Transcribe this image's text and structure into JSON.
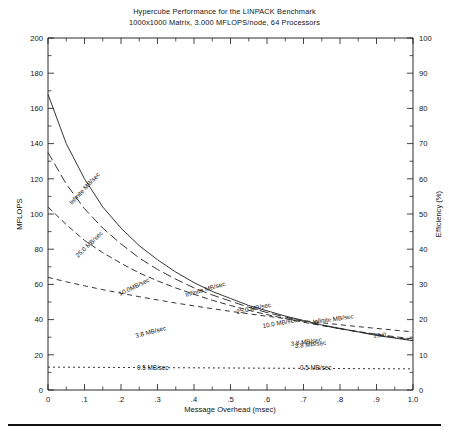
{
  "title": {
    "line1": "Hypercube Performance for the LINPACK Benchmark",
    "line2": "1000x1000 Matrix, 3.000 MFLOPS/node, 64 Processors"
  },
  "axes": {
    "y_left_title": "MFLOPS",
    "y_right_title": "Efficiency (%)",
    "x_title": "Message Overhead (msec)",
    "y_left_ticks": [
      "0",
      "20",
      "40",
      "60",
      "80",
      "100",
      "120",
      "140",
      "160",
      "180",
      "200"
    ],
    "y_right_ticks": [
      "0",
      "10",
      "20",
      "30",
      "40",
      "50",
      "60",
      "70",
      "80",
      "90",
      "100"
    ],
    "x_ticks": [
      "0",
      ".1",
      ".2",
      ".3",
      ".4",
      ".5",
      ".6",
      ".7",
      ".8",
      ".9",
      "1.0"
    ]
  },
  "curve_labels": {
    "infinite_1": "Infinite MB/sec",
    "infinite_2": "Infinite MB/sec",
    "infinite_3": "Infinite MB/sec",
    "mb25_1": "25.0 MB/sec",
    "mb25_2": "25.0 MB/sec",
    "mb25_3": "25.0",
    "mb10_1": "10.0MB/sec",
    "mb10_2": "10.0 MB/sec",
    "mb38_1": "3.8 MB/sec",
    "mb38_2": "3.8 MB/sec",
    "mb38_3": "3.8 MB/sec",
    "mb05_1": "0.5 MB/sec",
    "mb05_2": "0.5 MB/sec"
  },
  "chart_data": {
    "type": "line",
    "title": "Hypercube Performance for the LINPACK Benchmark",
    "subtitle": "1000x1000 Matrix, 3.000 MFLOPS/node, 64 Processors",
    "xlabel": "Message Overhead (msec)",
    "ylabel": "MFLOPS",
    "ylabel_right": "Efficiency (%)",
    "xlim": [
      0,
      1.0
    ],
    "ylim": [
      0,
      200
    ],
    "ylim_right": [
      0,
      100
    ],
    "xticks": [
      0,
      0.1,
      0.2,
      0.3,
      0.4,
      0.5,
      0.6,
      0.7,
      0.8,
      0.9,
      1.0
    ],
    "yticks": [
      0,
      20,
      40,
      60,
      80,
      100,
      120,
      140,
      160,
      180,
      200
    ],
    "yticks_right": [
      0,
      10,
      20,
      30,
      40,
      50,
      60,
      70,
      80,
      90,
      100
    ],
    "grid": false,
    "legend": "inline-curve-labels",
    "x": [
      0,
      0.05,
      0.1,
      0.15,
      0.2,
      0.25,
      0.3,
      0.35,
      0.4,
      0.45,
      0.5,
      0.55,
      0.6,
      0.65,
      0.7,
      0.75,
      0.8,
      0.85,
      0.9,
      0.95,
      1.0
    ],
    "series": [
      {
        "name": "Infinite MB/sec",
        "style": "solid",
        "values": [
          168,
          140,
          120,
          104,
          92,
          82,
          74,
          67,
          61,
          56,
          52,
          48,
          45,
          42,
          39.5,
          37,
          35,
          33,
          31,
          29.5,
          28
        ]
      },
      {
        "name": "25.0 MB/sec",
        "style": "long-dash",
        "values": [
          135,
          117,
          103,
          92,
          83,
          75,
          68.5,
          63,
          58,
          54,
          50.5,
          47,
          44,
          41.5,
          39,
          36.8,
          34.8,
          33,
          31.3,
          29.8,
          28.4
        ]
      },
      {
        "name": "10.0MB/sec",
        "style": "medium-dash",
        "values": [
          104,
          94,
          85,
          78,
          72,
          66.5,
          62,
          58,
          54.4,
          51,
          48,
          45.3,
          42.8,
          40.6,
          38.5,
          36.6,
          34.8,
          33.2,
          31.7,
          30.3,
          29
        ]
      },
      {
        "name": "3.8 MB/sec",
        "style": "dash",
        "values": [
          64,
          61.5,
          59.2,
          57,
          55,
          53,
          51.2,
          49.4,
          47.8,
          46.2,
          44.7,
          43.3,
          41.9,
          40.6,
          39.4,
          38.2,
          37.1,
          36,
          35,
          34,
          33
        ]
      },
      {
        "name": "0.5 MB/sec",
        "style": "dot",
        "values": [
          13,
          12.95,
          12.9,
          12.85,
          12.8,
          12.75,
          12.7,
          12.65,
          12.6,
          12.55,
          12.5,
          12.45,
          12.4,
          12.35,
          12.3,
          12.25,
          12.2,
          12.15,
          12.1,
          12.05,
          12
        ]
      }
    ]
  }
}
